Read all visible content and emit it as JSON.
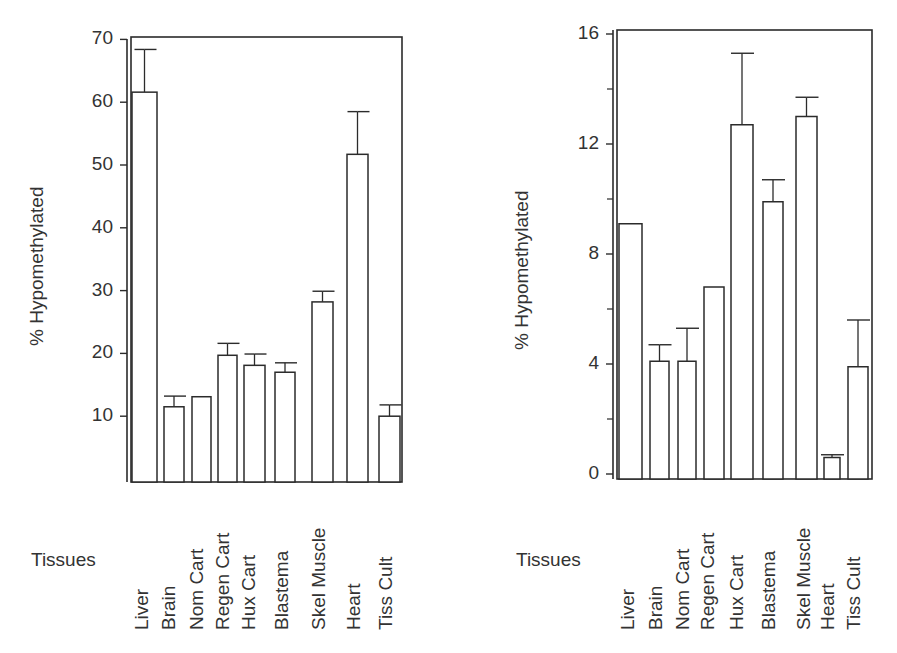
{
  "chart_data": [
    {
      "type": "bar",
      "title": "",
      "xlabel": "Tissues",
      "ylabel": "% Hypomethylated",
      "ylim": [
        0,
        70
      ],
      "yticks": [
        10,
        20,
        30,
        40,
        50,
        60,
        70
      ],
      "grid": false,
      "legend": null,
      "categories": [
        "Liver",
        "Brain",
        "Nom Cart",
        "Regen Cart",
        "Hux Cart",
        "Blastema",
        "Skel Muscle",
        "Heart",
        "Tiss Cult"
      ],
      "series": [
        {
          "name": "% Hypomethylated",
          "values": [
            61.6,
            11.5,
            13.1,
            19.7,
            18.1,
            17.0,
            28.2,
            51.7,
            10.0
          ],
          "error_upper": [
            68.4,
            13.2,
            13.1,
            21.6,
            19.9,
            18.5,
            29.9,
            58.5,
            11.8
          ]
        }
      ]
    },
    {
      "type": "bar",
      "title": "",
      "xlabel": "Tissues",
      "ylabel": "% Hypomethylated",
      "ylim": [
        0,
        16
      ],
      "yticks": [
        0,
        4,
        8,
        12,
        16
      ],
      "minor_yticks": [
        2,
        6,
        10,
        14
      ],
      "grid": false,
      "legend": null,
      "categories": [
        "Liver",
        "Brain",
        "Nom Cart",
        "Regen Cart",
        "Hux Cart",
        "Blastema",
        "Skel Muscle",
        "Heart",
        "Tiss Cult"
      ],
      "series": [
        {
          "name": "% Hypomethylated",
          "values": [
            9.1,
            4.1,
            4.1,
            6.8,
            12.7,
            9.9,
            13.0,
            0.6,
            3.9
          ],
          "error_upper": [
            9.1,
            4.7,
            5.3,
            6.8,
            15.3,
            10.7,
            13.7,
            0.7,
            5.6
          ]
        }
      ]
    }
  ],
  "left": {
    "ylabel": "% Hypomethylated",
    "xlabel": "Tissues",
    "ticks": [
      "70",
      "60",
      "50",
      "40",
      "30",
      "20",
      "10"
    ]
  },
  "right": {
    "ylabel": "% Hypomethylated",
    "xlabel": "Tissues",
    "ticks": [
      "16",
      "12",
      "8",
      "4",
      "0"
    ]
  },
  "categories": [
    "Liver",
    "Brain",
    "Nom Cart",
    "Regen Cart",
    "Hux Cart",
    "Blastema",
    "Skel Muscle",
    "Heart",
    "Tiss Cult"
  ]
}
